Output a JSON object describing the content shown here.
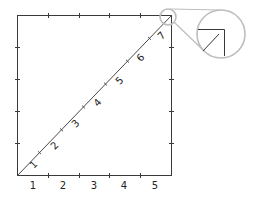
{
  "diagram": {
    "colors": {
      "frame": "#3a3a3a",
      "diagonal": "#4a4a4a",
      "magnifier": "#bdbdbd",
      "text": "#222222"
    },
    "square": {
      "x0": 17,
      "y0": 15,
      "x1": 171,
      "y1": 175
    },
    "side_divisions": 5,
    "diagonal_divisions": 7,
    "x_axis_labels": [
      "1",
      "2",
      "3",
      "4",
      "5"
    ],
    "diagonal_labels": [
      "1",
      "2",
      "3",
      "4",
      "5",
      "6",
      "7"
    ],
    "magnifier": {
      "small_circle": {
        "cx": 168,
        "cy": 17,
        "r": 8
      },
      "large_circle": {
        "cx": 221,
        "cy": 34,
        "r": 24
      }
    }
  }
}
